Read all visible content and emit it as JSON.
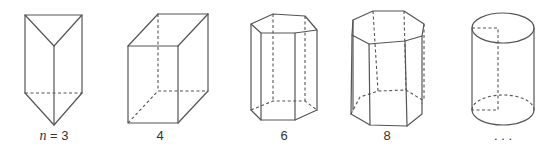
{
  "figure": {
    "shapes": [
      {
        "name": "triangular-prism",
        "sides": 3,
        "label_var": "n",
        "label_eq": " = ",
        "label_value": "3"
      },
      {
        "name": "square-prism",
        "sides": 4,
        "label": "4"
      },
      {
        "name": "hexagonal-prism",
        "sides": 6,
        "label": "6"
      },
      {
        "name": "octagonal-prism",
        "sides": 8,
        "label": "8"
      },
      {
        "name": "cylinder",
        "sides": "infinite",
        "label": ". . ."
      }
    ],
    "line_color": "#555555"
  }
}
